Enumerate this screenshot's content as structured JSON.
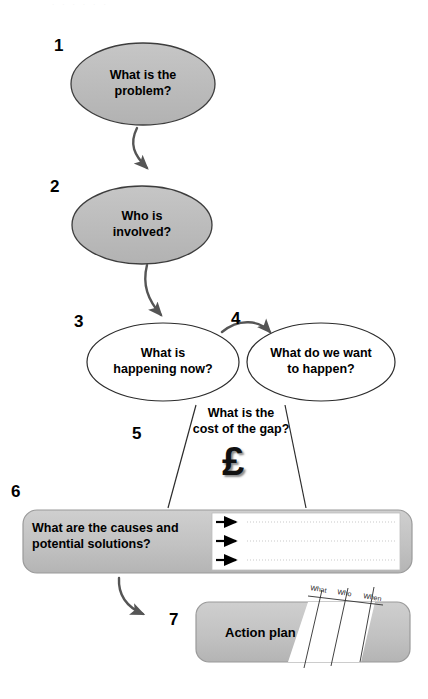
{
  "diagram": {
    "colors": {
      "node_fill_gray": "#bcbcbc",
      "node_fill_white": "#ffffff",
      "node_stroke": "#3a3a3a",
      "arrow_gray": "#555555",
      "text_black": "#000000",
      "panel_fill_gray": "#c4c4c4",
      "dotted_line": "#c9c9c9"
    },
    "steps": [
      {
        "number": "1",
        "name": "what-is-the-problem",
        "label": "What is the\nproblem?",
        "shape": "ellipse",
        "fill": "gray"
      },
      {
        "number": "2",
        "name": "who-is-involved",
        "label": "Who is\ninvolved?",
        "shape": "ellipse",
        "fill": "gray"
      },
      {
        "number": "3",
        "name": "what-is-happening-now",
        "label": "What is\nhappening now?",
        "shape": "ellipse",
        "fill": "white"
      },
      {
        "number": "4",
        "name": "what-do-we-want-to-happen",
        "label": "What do we want\nto happen?",
        "shape": "ellipse",
        "fill": "white"
      },
      {
        "number": "5",
        "name": "cost-of-the-gap",
        "label": "What is the\ncost of the gap?",
        "shape": "gap-wedge",
        "symbol": "£"
      },
      {
        "number": "6",
        "name": "causes-and-solutions",
        "label": "What are the causes and\npotential solutions?",
        "shape": "rounded-panel",
        "fill": "gray",
        "list_rows": 3
      },
      {
        "number": "7",
        "name": "action-plan",
        "label": "Action plan",
        "shape": "rounded-panel-table",
        "fill": "gray",
        "table_columns": [
          "What",
          "Who",
          "When"
        ]
      }
    ],
    "connections": [
      {
        "name": "arrow-1-to-2",
        "from": "1",
        "to": "2",
        "style": "curved-arrow"
      },
      {
        "name": "arrow-2-to-3",
        "from": "2",
        "to": "3",
        "style": "curved-arrow"
      },
      {
        "name": "arrow-3-to-4",
        "from": "3",
        "to": "4",
        "style": "curved-arrow"
      },
      {
        "name": "gap-line-left",
        "from": "3",
        "to": "6",
        "style": "straight-line"
      },
      {
        "name": "gap-line-right",
        "from": "4",
        "to": "6",
        "style": "straight-line"
      },
      {
        "name": "arrow-6-to-7",
        "from": "6",
        "to": "7",
        "style": "curved-arrow"
      }
    ]
  }
}
